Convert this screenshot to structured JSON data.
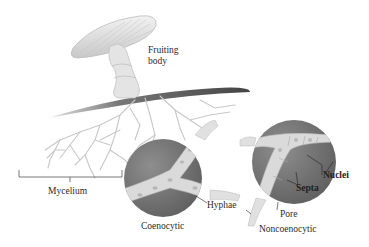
{
  "diagram": {
    "labels": {
      "fruiting_body": [
        "Fruiting",
        "body"
      ],
      "mycelium": "Mycelium",
      "coenocytic": "Coenocytic",
      "hyphae": "Hyphae",
      "nuclei": "Nuclei",
      "septa": "Septa",
      "pore": "Pore",
      "noncoenocytic": "Noncoenocytic"
    },
    "colors": {
      "background": "#ffffff",
      "circle_dark": "#6e6e6e",
      "circle_mid": "#8a8a8a",
      "hypha_fill": "#dcdcdc",
      "soil": "#555555",
      "mushroom": "#d6d6d6",
      "text": "#2a2a2a"
    }
  }
}
